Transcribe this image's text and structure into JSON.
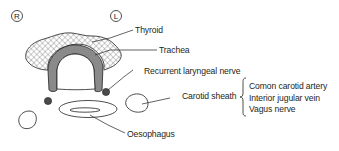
{
  "diagram": {
    "type": "anatomical cross-section",
    "orientation_markers": {
      "right": "R",
      "left": "L"
    },
    "labels": {
      "thyroid": "Thyroid",
      "trachea": "Trachea",
      "recurrent_laryngeal_nerve": "Recurrent laryngeal nerve",
      "carotid_sheath": "Carotid sheath",
      "oesophagus": "Oesophagus"
    },
    "carotid_sheath_contents": [
      "Comon carotid artery",
      "Interior jugular vein",
      "Vagus nerve"
    ],
    "colors": {
      "line": "#231f20",
      "trachea_fill": "#8a8a8a",
      "nerve_fill": "#4a4a4a",
      "hatch": "#6d6d6d"
    }
  }
}
